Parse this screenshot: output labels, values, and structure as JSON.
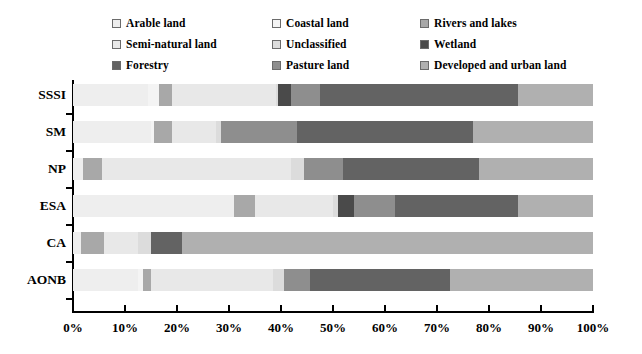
{
  "chart_data": {
    "type": "bar",
    "orientation": "horizontal",
    "stacked": true,
    "stacked_normalized": true,
    "title": "",
    "xlabel": "",
    "ylabel": "",
    "xlim": [
      0,
      100
    ],
    "grid": false,
    "legend_position": "top",
    "xticks": [
      "0%",
      "10%",
      "20%",
      "30%",
      "40%",
      "50%",
      "60%",
      "70%",
      "80%",
      "90%",
      "100%"
    ],
    "xtick_values": [
      0,
      10,
      20,
      30,
      40,
      50,
      60,
      70,
      80,
      90,
      100
    ],
    "categories": [
      "SSSI",
      "SM",
      "NP",
      "ESA",
      "CA",
      "AONB"
    ],
    "series": [
      {
        "name": "Arable land",
        "color": "#eeeeee",
        "values": [
          14.5,
          15.0,
          2.0,
          31.0,
          1.5,
          12.5
        ]
      },
      {
        "name": "Coastal land",
        "color": "#f4f4f4",
        "values": [
          2.0,
          0.5,
          0.0,
          0.0,
          0.0,
          1.0
        ]
      },
      {
        "name": "Rivers and lakes",
        "color": "#a8a8a8",
        "values": [
          2.5,
          3.5,
          3.5,
          4.0,
          4.5,
          1.5
        ]
      },
      {
        "name": "Semi-natural land",
        "color": "#e8e8e8",
        "values": [
          20.0,
          8.5,
          36.5,
          15.0,
          6.5,
          23.5
        ]
      },
      {
        "name": "Unclassified",
        "color": "#dcdcdc",
        "values": [
          0.5,
          1.0,
          2.5,
          1.0,
          2.5,
          2.0
        ]
      },
      {
        "name": "Wetland",
        "color": "#4a4a4a",
        "values": [
          2.5,
          0.0,
          0.0,
          3.0,
          0.0,
          0.0
        ]
      },
      {
        "name": "Pasture land",
        "color": "#8e8e8e",
        "values": [
          5.5,
          14.5,
          7.5,
          8.0,
          0.0,
          5.0
        ]
      },
      {
        "name": "Forestry",
        "color": "#636363",
        "values": [
          38.0,
          34.0,
          26.0,
          23.5,
          6.0,
          27.0
        ]
      },
      {
        "name": "Developed and urban land",
        "color": "#b0b0b0",
        "values": [
          14.5,
          23.0,
          22.0,
          14.5,
          79.0,
          27.5
        ]
      }
    ]
  },
  "legend": {
    "items": [
      {
        "label": "Arable land",
        "swatch": "#eeeeee"
      },
      {
        "label": "Coastal land",
        "swatch": "#f4f4f4"
      },
      {
        "label": "Rivers and lakes",
        "swatch": "#a8a8a8"
      },
      {
        "label": "Semi-natural land",
        "swatch": "#e8e8e8"
      },
      {
        "label": "Unclassified",
        "swatch": "#dcdcdc"
      },
      {
        "label": "Wetland",
        "swatch": "#4a4a4a"
      },
      {
        "label": "Forestry",
        "swatch": "#636363"
      },
      {
        "label": "Pasture land",
        "swatch": "#8e8e8e"
      },
      {
        "label": "Developed and urban land",
        "swatch": "#b0b0b0"
      }
    ],
    "order": [
      0,
      1,
      2,
      3,
      4,
      5,
      6,
      7,
      8
    ]
  }
}
